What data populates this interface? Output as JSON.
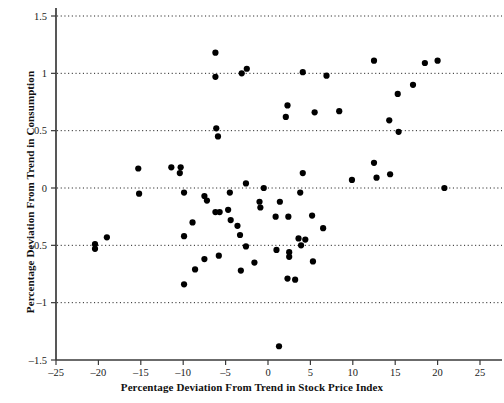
{
  "chart_data": {
    "type": "scatter",
    "title": "",
    "subtitle": "",
    "xlabel": "Percentage Deviation From Trend in Stock Price Index",
    "ylabel": "Percentage Deviation From Trend in Consumption",
    "xlim": [
      -25,
      25
    ],
    "ylim": [
      -1.5,
      1.5
    ],
    "xticks": [
      -25,
      -20,
      -15,
      -10,
      -5,
      0,
      5,
      10,
      15,
      20,
      25
    ],
    "xtick_labels": [
      "–25",
      "–20",
      "–15",
      "–10",
      "–5",
      "0",
      "5",
      "10",
      "15",
      "20",
      "25"
    ],
    "yticks": [
      -1.5,
      -1,
      -0.5,
      0,
      0.5,
      1,
      1.5
    ],
    "ytick_labels": [
      "–1.5",
      "–1",
      "–0.5",
      "0",
      "0.5",
      "1",
      "1.5"
    ],
    "grid": "horizontal-dotted",
    "gridlines_y": [
      -1,
      -0.5,
      0,
      0.5,
      1,
      1.5
    ],
    "legend": null,
    "legend_position": "none",
    "marker": "filled-circle",
    "marker_color": "#000000",
    "marker_size": 4.2,
    "series": [
      {
        "name": "Stock price deviation vs consumption deviation",
        "points": [
          [
            -20.4,
            -0.49
          ],
          [
            -20.4,
            -0.53
          ],
          [
            -19.0,
            -0.43
          ],
          [
            -15.3,
            0.17
          ],
          [
            -15.2,
            -0.05
          ],
          [
            -11.4,
            0.18
          ],
          [
            -10.3,
            0.18
          ],
          [
            -10.4,
            0.13
          ],
          [
            -9.9,
            -0.04
          ],
          [
            -9.9,
            -0.42
          ],
          [
            -9.9,
            -0.84
          ],
          [
            -8.9,
            -0.3
          ],
          [
            -8.6,
            -0.71
          ],
          [
            -7.5,
            -0.07
          ],
          [
            -7.2,
            -0.11
          ],
          [
            -7.5,
            -0.62
          ],
          [
            -6.2,
            1.18
          ],
          [
            -6.2,
            0.97
          ],
          [
            -6.1,
            0.52
          ],
          [
            -5.9,
            0.45
          ],
          [
            -6.2,
            -0.21
          ],
          [
            -5.7,
            -0.21
          ],
          [
            -5.8,
            -0.59
          ],
          [
            -4.7,
            -0.19
          ],
          [
            -4.5,
            -0.04
          ],
          [
            -4.4,
            -0.28
          ],
          [
            -3.6,
            -0.33
          ],
          [
            -3.1,
            1.0
          ],
          [
            -3.3,
            -0.41
          ],
          [
            -3.2,
            -0.72
          ],
          [
            -2.5,
            1.04
          ],
          [
            -2.6,
            0.04
          ],
          [
            -2.6,
            -0.51
          ],
          [
            -1.6,
            -0.65
          ],
          [
            -1.0,
            -0.12
          ],
          [
            -0.9,
            -0.17
          ],
          [
            -0.5,
            0.0
          ],
          [
            0.9,
            -0.25
          ],
          [
            1.0,
            -0.54
          ],
          [
            1.4,
            -0.12
          ],
          [
            1.3,
            -1.38
          ],
          [
            2.3,
            0.72
          ],
          [
            2.1,
            0.62
          ],
          [
            2.4,
            -0.25
          ],
          [
            2.5,
            -0.56
          ],
          [
            2.5,
            -0.6
          ],
          [
            2.3,
            -0.79
          ],
          [
            3.2,
            -0.8
          ],
          [
            3.6,
            -0.44
          ],
          [
            3.8,
            -0.04
          ],
          [
            3.9,
            -0.5
          ],
          [
            4.1,
            1.01
          ],
          [
            4.1,
            0.13
          ],
          [
            4.4,
            -0.45
          ],
          [
            5.2,
            -0.24
          ],
          [
            5.3,
            -0.64
          ],
          [
            5.5,
            0.66
          ],
          [
            6.5,
            -0.35
          ],
          [
            6.9,
            0.98
          ],
          [
            8.4,
            0.67
          ],
          [
            9.9,
            0.07
          ],
          [
            12.5,
            1.11
          ],
          [
            12.5,
            0.22
          ],
          [
            12.8,
            0.09
          ],
          [
            14.3,
            0.59
          ],
          [
            14.4,
            0.12
          ],
          [
            15.3,
            0.82
          ],
          [
            15.4,
            0.49
          ],
          [
            17.1,
            0.9
          ],
          [
            18.5,
            1.09
          ],
          [
            20.0,
            1.11
          ],
          [
            20.8,
            0.0
          ]
        ]
      }
    ]
  },
  "figure": {
    "background_color": "#ffffff",
    "axis_color": "#3a3a3a",
    "gridline_color": "#222222",
    "point_count": 72
  }
}
